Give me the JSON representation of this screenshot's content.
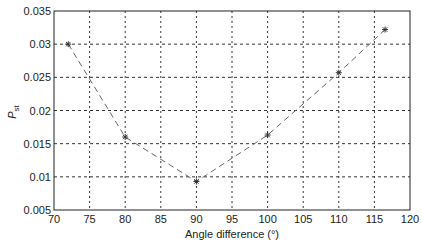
{
  "chart_data": {
    "type": "line",
    "title": "",
    "xlabel": "Angle difference (°)",
    "ylabel": "P",
    "ylabel_subscript": "st",
    "xlim": [
      70,
      120
    ],
    "ylim": [
      0.005,
      0.035
    ],
    "xticks": [
      70,
      75,
      80,
      85,
      90,
      95,
      100,
      105,
      110,
      115,
      120
    ],
    "yticks": [
      0.005,
      0.01,
      0.015,
      0.02,
      0.025,
      0.03,
      0.035
    ],
    "xtick_labels": [
      "70",
      "75",
      "80",
      "85",
      "90",
      "95",
      "100",
      "105",
      "110",
      "115",
      "120"
    ],
    "ytick_labels": [
      "0.005",
      "0.01",
      "0.015",
      "0.02",
      "0.025",
      "0.03",
      "0.035"
    ],
    "grid": true,
    "legend": null,
    "series": [
      {
        "name": "P_st",
        "style": "dashed",
        "marker": "star",
        "color": "#555555",
        "x": [
          72,
          80,
          90,
          100,
          110,
          116.5
        ],
        "y": [
          0.03,
          0.016,
          0.0093,
          0.0163,
          0.0257,
          0.0322
        ]
      }
    ]
  }
}
